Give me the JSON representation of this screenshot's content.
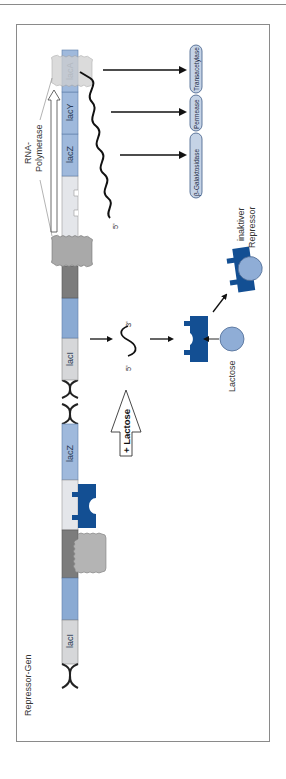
{
  "figure": {
    "title_line": "",
    "orientation": "rotated-90-ccw",
    "colors": {
      "repressor_blue": "#134f93",
      "lactose_blue": "#8fadd6",
      "gene_blue": "#9fb9dc",
      "gene_light": "#d6d7d9",
      "promoter_dark": "#7c7c7c",
      "operator_light": "#e4e6ea",
      "polymerase_gray": "#b4b4b4",
      "enzyme_fill": "#c5d3e6",
      "frame": "#8a8a8a"
    }
  },
  "repressed_state": {
    "labels": {
      "repressor_gene": "Repressor-Gen",
      "promoter_region": "Promotor-Region",
      "operator": "Operator",
      "rna_polymerase_line1": "RNA-",
      "rna_polymerase_line2": "Polymerase",
      "no_mrna_line1": "es wird keine",
      "no_mrna_line2": "mRNA hergestellt",
      "active_repressor_line1": "aktiver",
      "active_repressor_line2": "Repressor",
      "mrna_5": "5'",
      "mrna_3": "3'"
    },
    "genes": {
      "laci": "lacI",
      "lacz": "lacZ"
    }
  },
  "transition": {
    "arrow_label": "+ Lactose"
  },
  "induced_state": {
    "labels": {
      "rna_polymerase_line1": "RNA-",
      "rna_polymerase_line2": "Polymerase",
      "lactose": "Lactose",
      "inactive_repressor_line1": "inaktiver",
      "inactive_repressor_line2": "Repressor",
      "mrna_5": "5'",
      "mrna_3": "3'",
      "polycistronic_5": "5'"
    },
    "genes": {
      "laci": "lacI",
      "lacz": "lacZ",
      "lacy": "lacY",
      "laca": "lacA"
    },
    "enzymes": [
      "β-Galaktosidase",
      "Permease",
      "Transacetylase"
    ]
  }
}
